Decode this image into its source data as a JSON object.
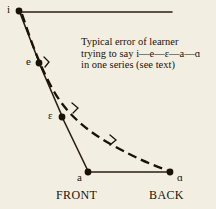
{
  "figure": {
    "type": "vowel-diagram",
    "background_color": "#f2efe2",
    "ink_color": "#1a1208",
    "width": 216,
    "height": 209
  },
  "caption": {
    "line1": "Typical error of learner",
    "line2_prefix": "trying to say",
    "line2_sequence": "i—e—ɛ—a—ɑ",
    "line3": "in one series (see text)"
  },
  "axis_labels": {
    "front": "FRONT",
    "back": "BACK"
  },
  "vowels": [
    {
      "symbol": "i",
      "x": 19,
      "y": 11,
      "label_x": 7,
      "label_y": 5
    },
    {
      "symbol": "e",
      "x": 39,
      "y": 63,
      "label_x": 27,
      "label_y": 57
    },
    {
      "symbol": "ɛ",
      "x": 62,
      "y": 117,
      "label_x": 49,
      "label_y": 111
    },
    {
      "symbol": "a",
      "x": 88,
      "y": 172,
      "label_x": 77,
      "label_y": 168
    },
    {
      "symbol": "ɑ",
      "x": 170,
      "y": 172,
      "label_x": 176,
      "label_y": 168
    }
  ],
  "ideal_path": {
    "description": "solid quadrilateral outline connecting i-e-ɛ-a and the top and bottom horizontal rails",
    "segments": [
      {
        "from": "i",
        "to": "top-right-rail",
        "x1": 19,
        "y1": 11,
        "x2": 172,
        "y2": 12
      },
      {
        "from": "i",
        "to": "e",
        "x1": 19,
        "y1": 11,
        "x2": 39,
        "y2": 63
      },
      {
        "from": "e",
        "to": "ɛ",
        "x1": 39,
        "y1": 63,
        "x2": 62,
        "y2": 117
      },
      {
        "from": "ɛ",
        "to": "a",
        "x1": 62,
        "y1": 117,
        "x2": 88,
        "y2": 172
      },
      {
        "from": "a",
        "to": "ɑ",
        "x1": 88,
        "y1": 172,
        "x2": 170,
        "y2": 172
      }
    ]
  },
  "error_path": {
    "style": "dashed",
    "description": "dashed curve bowing right from i down to ɑ, representing the learner's erroneous glide",
    "points": [
      {
        "x": 22,
        "y": 13
      },
      {
        "x": 34,
        "y": 48
      },
      {
        "x": 46,
        "y": 76
      },
      {
        "x": 62,
        "y": 103
      },
      {
        "x": 82,
        "y": 126
      },
      {
        "x": 108,
        "y": 144
      },
      {
        "x": 136,
        "y": 157
      },
      {
        "x": 166,
        "y": 170
      }
    ],
    "direction_ticks": [
      {
        "x": 48,
        "y": 61
      },
      {
        "x": 76,
        "y": 108
      },
      {
        "x": 114,
        "y": 140
      }
    ]
  }
}
